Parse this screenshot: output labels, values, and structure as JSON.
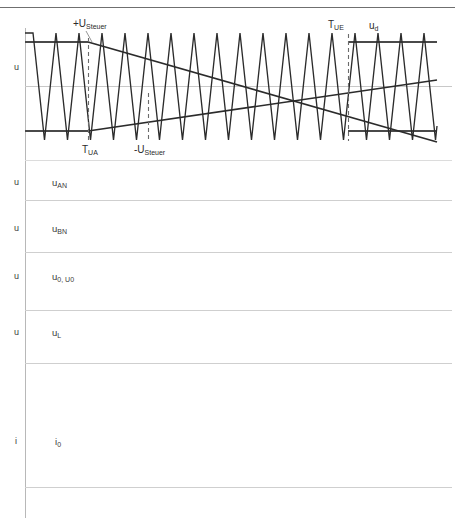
{
  "page": {
    "header_note": "",
    "background": "#ffffff",
    "width": 455,
    "height": 529
  },
  "colors": {
    "carrier": "#2b2b2b",
    "reference": "#2b2b2b",
    "rail": "#555555",
    "zero_axis": "#c8c8c8",
    "divider": "#cfcfcf",
    "vertical_axis": "#b8b8b8",
    "dashed": "#6b6b6b",
    "text": "#2b2b2b"
  },
  "annotations": {
    "pos_steuer": "+U",
    "pos_steuer_sub": "Steuer",
    "neg_steuer": "-U",
    "neg_steuer_sub": "Steuer",
    "t_ua": "T",
    "t_ua_sub": "UA",
    "t_ue": "T",
    "t_ue_sub": "UE",
    "u_d": "u",
    "u_d_sub": "d"
  },
  "panels": [
    {
      "name": "carrier-modulation",
      "axis_label": "u",
      "signal_label": "",
      "signal_sub": "",
      "top": 18,
      "bottom": 160
    },
    {
      "name": "u-an",
      "axis_label": "u",
      "signal_label": "u",
      "signal_sub": "AN",
      "top": 160,
      "bottom": 200
    },
    {
      "name": "u-bn",
      "axis_label": "u",
      "signal_label": "u",
      "signal_sub": "BN",
      "top": 200,
      "bottom": 252
    },
    {
      "name": "u0-U0",
      "axis_label": "u",
      "signal_label": "u",
      "signal_sub": "0,  U",
      "signal_sub2": "0",
      "top": 252,
      "bottom": 310
    },
    {
      "name": "u-l",
      "axis_label": "u",
      "signal_label": "u",
      "signal_sub": "L",
      "top": 310,
      "bottom": 363
    },
    {
      "name": "i-0",
      "axis_label": "i",
      "signal_label": "i",
      "signal_sub": "0",
      "top": 363,
      "bottom": 487
    }
  ],
  "chart_data": {
    "type": "line",
    "xlabel": "",
    "ylabel": "u",
    "grid": false,
    "legend": "none",
    "x_range": [
      25,
      437
    ],
    "plot_area": {
      "left": 25,
      "right": 437,
      "top": 28,
      "bottom": 142
    },
    "levels": {
      "upper_rail_y": 42,
      "zero_y": 86,
      "lower_rail_y": 131
    },
    "carrier": {
      "name": "triangular carrier",
      "shape": "triangle",
      "period_px": 23.0,
      "first_peak_x": 33,
      "peak_count": 18,
      "amplitude_top": 33,
      "amplitude_bottom": 140
    },
    "series": [
      {
        "name": "+U_Steuer (descending reference)",
        "points": [
          [
            25,
            42
          ],
          [
            88,
            42
          ],
          [
            437,
            142
          ]
        ],
        "style": "solid"
      },
      {
        "name": "-U_Steuer (ascending reference)",
        "points": [
          [
            25,
            131
          ],
          [
            88,
            131
          ],
          [
            437,
            80
          ]
        ],
        "style": "solid"
      },
      {
        "name": "upper rail u_d",
        "points": [
          [
            25,
            42
          ],
          [
            88,
            42
          ]
        ],
        "style": "solid-bold"
      },
      {
        "name": "upper rail right",
        "points": [
          [
            348,
            42
          ],
          [
            437,
            42
          ]
        ],
        "style": "solid-bold"
      },
      {
        "name": "lower rail left",
        "points": [
          [
            25,
            131
          ],
          [
            88,
            131
          ]
        ],
        "style": "solid-bold"
      },
      {
        "name": "lower rail right",
        "points": [
          [
            348,
            131
          ],
          [
            437,
            131
          ]
        ],
        "style": "solid-bold"
      }
    ],
    "markers": [
      {
        "label": "T_UA",
        "x": 88,
        "y_top": 38,
        "y_bottom": 140,
        "style": "dashed"
      },
      {
        "label": "-U_Steuer",
        "x": 148,
        "y_top": 93,
        "y_bottom": 140,
        "style": "dashed"
      },
      {
        "label": "T_UE",
        "x": 348,
        "y_top": 34,
        "y_bottom": 140,
        "style": "dashed"
      }
    ]
  }
}
